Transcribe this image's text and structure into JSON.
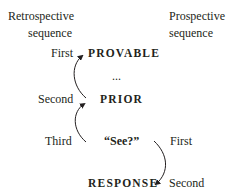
{
  "headers": {
    "left": [
      "Retrospective",
      "sequence"
    ],
    "right": [
      "Prospective",
      "sequence"
    ]
  },
  "nodes": {
    "provable": "PROVABLE",
    "ellipsis": "...",
    "prior": "PRIOR",
    "see": "“See?”",
    "response": "RESPONSE"
  },
  "retrospective_labels": {
    "first": "First",
    "second": "Second",
    "third": "Third"
  },
  "prospective_labels": {
    "first": "First",
    "second": "Second"
  },
  "colors": {
    "text": "#231f20",
    "arrow": "#231f20"
  }
}
